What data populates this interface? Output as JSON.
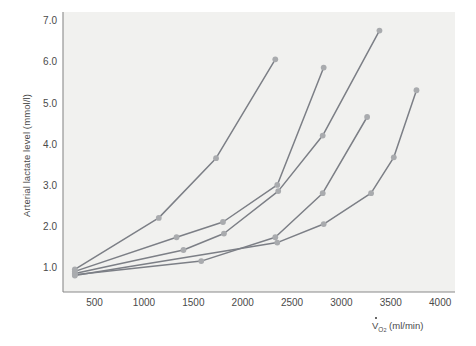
{
  "figure": {
    "plot_bg_color": "#f1f1ef",
    "page_bg_color": "#ffffff",
    "axis_color": "#8a8a8a",
    "line_color": "#7c7f86",
    "marker_color": "#a9abae",
    "text_color": "#4a4a4a"
  },
  "annotations": {
    "anaerobic_line1": "Anaerobic",
    "anaerobic_line2": "Threshold",
    "aerobic_line1": "Aerobic",
    "aerobic_line2": "Threshold"
  },
  "axis_text": {
    "ylabel": "Arterial lactate level (mmol/l)",
    "xlabel_v": "V",
    "xlabel_sub": "O",
    "xlabel_sub2": "2",
    "xlabel_units": "(ml/min)"
  },
  "chart_data": {
    "type": "line",
    "title": "",
    "xlabel": "VO2 (ml/min)",
    "ylabel": "Arterial lactate level (mmol/l)",
    "xlim": [
      180,
      4150
    ],
    "ylim": [
      0.45,
      7.25
    ],
    "xticks": [
      500,
      1000,
      1500,
      2000,
      2500,
      3000,
      3500,
      4000
    ],
    "yticks": [
      1.0,
      2.0,
      3.0,
      4.0,
      5.0,
      6.0,
      7.0
    ],
    "ytick_labels": [
      "1.0",
      "2.0",
      "3.0",
      "4.0",
      "5.0",
      "6.0",
      "7.0"
    ],
    "xtick_labels": [
      "500",
      "1000",
      "1500",
      "2000",
      "2500",
      "3000",
      "3500",
      "4000"
    ],
    "grid": false,
    "legend_position": "inline-end-labels",
    "markers": "filled-circle",
    "annotations": [
      {
        "text": "Anaerobic Threshold",
        "lactate_level": 4.0
      },
      {
        "text": "Aerobic Threshold",
        "lactate_level": 2.0
      }
    ],
    "series": [
      {
        "name": "A",
        "label": "A",
        "points": [
          {
            "x": 300,
            "y": 1.0
          },
          {
            "x": 1150,
            "y": 2.25
          },
          {
            "x": 1730,
            "y": 3.7
          },
          {
            "x": 2330,
            "y": 6.1
          }
        ]
      },
      {
        "name": "B",
        "label": "B",
        "points": [
          {
            "x": 300,
            "y": 0.95
          },
          {
            "x": 1330,
            "y": 1.78
          },
          {
            "x": 1800,
            "y": 2.15
          },
          {
            "x": 2350,
            "y": 3.05
          },
          {
            "x": 2820,
            "y": 5.9
          }
        ]
      },
      {
        "name": "C",
        "label": "C",
        "points": [
          {
            "x": 300,
            "y": 0.9
          },
          {
            "x": 1400,
            "y": 1.47
          },
          {
            "x": 1810,
            "y": 1.87
          },
          {
            "x": 2360,
            "y": 2.9
          },
          {
            "x": 2810,
            "y": 4.25
          },
          {
            "x": 3385,
            "y": 6.8
          }
        ]
      },
      {
        "name": "D",
        "label": "D",
        "points": [
          {
            "x": 300,
            "y": 0.87
          },
          {
            "x": 1580,
            "y": 1.2
          },
          {
            "x": 2330,
            "y": 1.78
          },
          {
            "x": 2810,
            "y": 2.85
          },
          {
            "x": 3260,
            "y": 4.7
          }
        ]
      },
      {
        "name": "E",
        "label": "E",
        "points": [
          {
            "x": 300,
            "y": 0.85
          },
          {
            "x": 2350,
            "y": 1.65
          },
          {
            "x": 2820,
            "y": 2.1
          },
          {
            "x": 3300,
            "y": 2.85
          },
          {
            "x": 3530,
            "y": 3.72
          },
          {
            "x": 3760,
            "y": 5.35
          }
        ]
      }
    ]
  }
}
